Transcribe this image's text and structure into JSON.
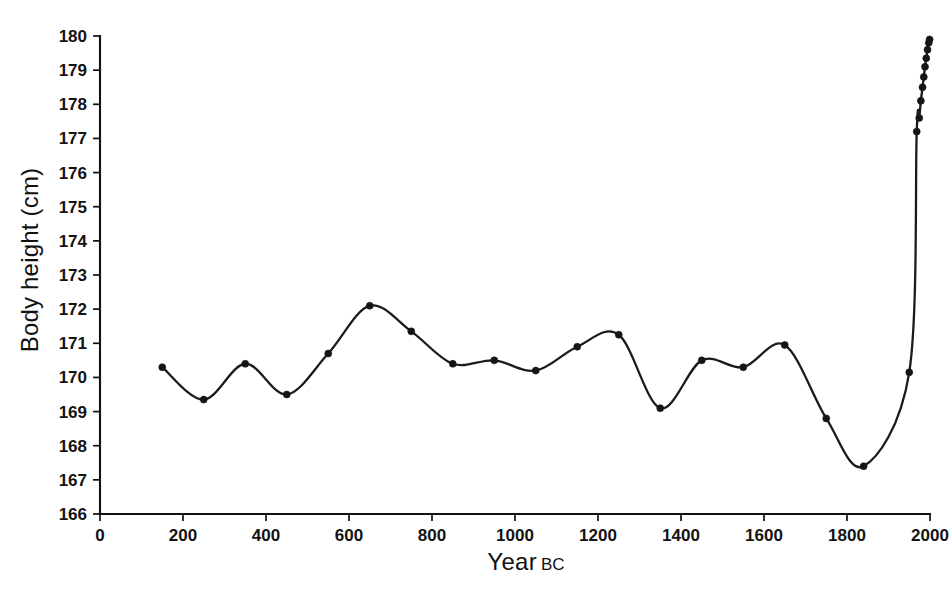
{
  "chart_data": {
    "type": "line",
    "title": "",
    "subtitle": "",
    "xlabel": "Year",
    "xlabel_suffix": "BC",
    "ylabel": "Body height (cm)",
    "xlim": [
      0,
      2000
    ],
    "ylim": [
      166,
      180
    ],
    "xticks": [
      0,
      200,
      400,
      600,
      800,
      1000,
      1200,
      1400,
      1600,
      1800,
      2000
    ],
    "xtick_labels": [
      "0",
      "200",
      "400",
      "600",
      "800",
      "1000",
      "1200",
      "1400",
      "1600",
      "1800",
      "2000"
    ],
    "yticks": [
      166,
      167,
      168,
      169,
      170,
      171,
      172,
      173,
      174,
      175,
      176,
      177,
      178,
      179,
      180
    ],
    "ytick_labels": [
      "166",
      "167",
      "168",
      "169",
      "170",
      "171",
      "172",
      "173",
      "174",
      "175",
      "176",
      "177",
      "178",
      "179",
      "180"
    ],
    "grid": false,
    "legend": null,
    "line_color": "#1b1b1b",
    "marker_color": "#151515",
    "axis_color": "#111111",
    "background_color": "#ffffff",
    "series": [
      {
        "name": "Body height",
        "x": [
          150,
          250,
          350,
          450,
          550,
          650,
          750,
          850,
          950,
          1050,
          1150,
          1250,
          1350,
          1450,
          1550,
          1650,
          1750,
          1840,
          1950,
          1968,
          1974,
          1978,
          1982,
          1985,
          1988,
          1991,
          1994,
          1997,
          1999
        ],
        "y": [
          170.3,
          169.35,
          170.4,
          169.5,
          170.7,
          172.1,
          171.35,
          170.4,
          170.5,
          170.2,
          170.9,
          171.25,
          169.1,
          170.5,
          170.3,
          170.95,
          168.8,
          167.4,
          170.15,
          177.2,
          177.6,
          178.1,
          178.5,
          178.8,
          179.1,
          179.35,
          179.6,
          179.8,
          179.9
        ]
      }
    ]
  }
}
